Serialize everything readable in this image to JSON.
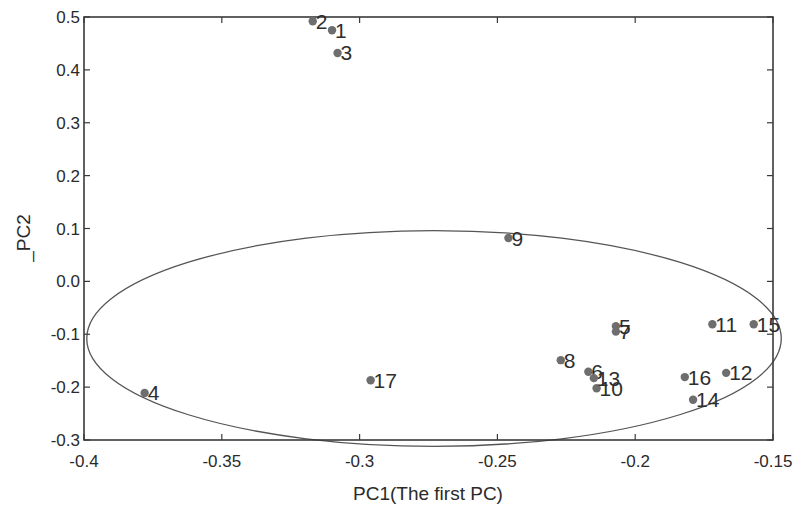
{
  "chart_data": {
    "type": "scatter",
    "title": "",
    "xlabel": "PC1(The first PC)",
    "ylabel": "_PC2",
    "xlim": [
      -0.4,
      -0.15
    ],
    "ylim": [
      -0.3,
      0.5
    ],
    "xticks": [
      -0.4,
      -0.35,
      -0.3,
      -0.25,
      -0.2,
      -0.15
    ],
    "xtick_labels": [
      "-0.4",
      "-0.35",
      "-0.3",
      "-0.25",
      "-0.2",
      "-0.15"
    ],
    "yticks": [
      0.5,
      0.4,
      0.3,
      0.2,
      0.1,
      0.0,
      -0.1,
      -0.2,
      -0.3
    ],
    "ytick_labels": [
      "0.5",
      "0.4",
      "0.3",
      "0.2",
      "0.1",
      "0.0",
      "-0.1",
      "-0.2",
      "-0.3"
    ],
    "grid": false,
    "legend": null,
    "marker_color": "#6e6e6e",
    "line_color": "#555555",
    "points": [
      {
        "label": "1",
        "x": -0.31,
        "y": 0.475
      },
      {
        "label": "2",
        "x": -0.317,
        "y": 0.492
      },
      {
        "label": "3",
        "x": -0.308,
        "y": 0.432
      },
      {
        "label": "4",
        "x": -0.378,
        "y": -0.211
      },
      {
        "label": "5",
        "x": -0.207,
        "y": -0.085
      },
      {
        "label": "6",
        "x": -0.217,
        "y": -0.171
      },
      {
        "label": "7",
        "x": -0.207,
        "y": -0.095
      },
      {
        "label": "8",
        "x": -0.227,
        "y": -0.149
      },
      {
        "label": "9",
        "x": -0.246,
        "y": 0.082
      },
      {
        "label": "10",
        "x": -0.214,
        "y": -0.202
      },
      {
        "label": "11",
        "x": -0.172,
        "y": -0.081
      },
      {
        "label": "12",
        "x": -0.167,
        "y": -0.173
      },
      {
        "label": "13",
        "x": -0.215,
        "y": -0.183
      },
      {
        "label": "14",
        "x": -0.179,
        "y": -0.224
      },
      {
        "label": "15",
        "x": -0.157,
        "y": -0.081
      },
      {
        "label": "16",
        "x": -0.182,
        "y": -0.181
      },
      {
        "label": "17",
        "x": -0.296,
        "y": -0.187
      }
    ],
    "annotations": [
      {
        "type": "ellipse",
        "description": "confidence ellipse",
        "center": [
          -0.273,
          -0.108
        ],
        "x_radius": 0.126,
        "y_radius": 0.204
      }
    ]
  }
}
